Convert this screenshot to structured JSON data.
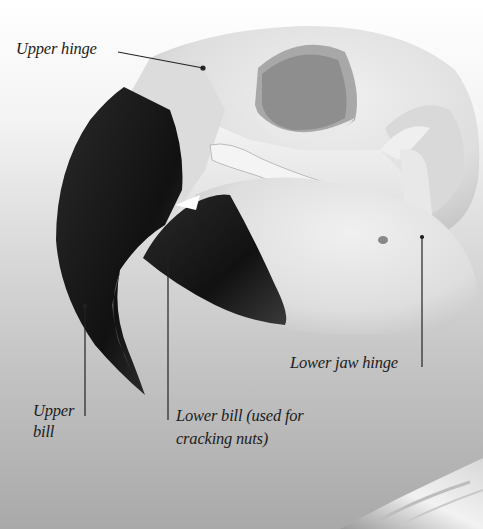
{
  "figure": {
    "palette": {
      "background_top": "#ffffff",
      "background_bottom": "#a9a9a9",
      "bone": "#e6e6e6",
      "bone_shadow": "#cfcfcf",
      "beak": "#1a1a1a",
      "leader_line": "#222222",
      "label_text": "#1c1c1c"
    }
  },
  "labels": {
    "upper_hinge": "Upper hinge",
    "upper_bill_line1": "Upper",
    "upper_bill_line2": "bill",
    "lower_bill_line1": "Lower bill (used for",
    "lower_bill_line2": "cracking nuts)",
    "lower_jaw_hinge": "Lower jaw hinge"
  }
}
